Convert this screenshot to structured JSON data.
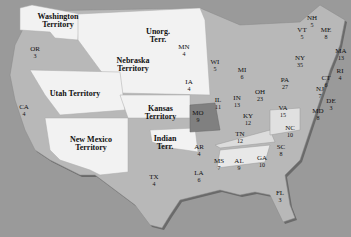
{
  "map": {
    "colors": {
      "ocean": "#9a9a9a",
      "state": "#b8b8b8",
      "territory": "#f2f2f2",
      "highlight": "#808080",
      "light_state": "#dcdcdc"
    },
    "territories": [
      {
        "id": "washington",
        "label": "Washington Territory"
      },
      {
        "id": "nebraska",
        "label": "Nebraska Territory"
      },
      {
        "id": "unorganized",
        "label": "Unorg. Terr."
      },
      {
        "id": "utah",
        "label": "Utah Territory"
      },
      {
        "id": "kansas",
        "label": "Kansas Territory"
      },
      {
        "id": "new-mexico",
        "label": "New Mexico Territory"
      },
      {
        "id": "indian",
        "label": "Indian Terr."
      }
    ],
    "states": [
      {
        "abbr": "OR",
        "value": "3"
      },
      {
        "abbr": "CA",
        "value": "4"
      },
      {
        "abbr": "TX",
        "value": "4"
      },
      {
        "abbr": "MN",
        "value": "4"
      },
      {
        "abbr": "IA",
        "value": "4"
      },
      {
        "abbr": "MO",
        "value": "9"
      },
      {
        "abbr": "AR",
        "value": "4"
      },
      {
        "abbr": "LA",
        "value": "6"
      },
      {
        "abbr": "WI",
        "value": "5"
      },
      {
        "abbr": "IL",
        "value": "11"
      },
      {
        "abbr": "MS",
        "value": "7"
      },
      {
        "abbr": "MI",
        "value": "6"
      },
      {
        "abbr": "IN",
        "value": "13"
      },
      {
        "abbr": "KY",
        "value": "12"
      },
      {
        "abbr": "TN",
        "value": "12"
      },
      {
        "abbr": "AL",
        "value": "9"
      },
      {
        "abbr": "OH",
        "value": "23"
      },
      {
        "abbr": "GA",
        "value": "10"
      },
      {
        "abbr": "FL",
        "value": "3"
      },
      {
        "abbr": "SC",
        "value": "8"
      },
      {
        "abbr": "NC",
        "value": "10"
      },
      {
        "abbr": "VA",
        "value": "15"
      },
      {
        "abbr": "PA",
        "value": "27"
      },
      {
        "abbr": "NY",
        "value": "35"
      },
      {
        "abbr": "VT",
        "value": "5"
      },
      {
        "abbr": "NH",
        "value": "5"
      },
      {
        "abbr": "ME",
        "value": "8"
      },
      {
        "abbr": "MA",
        "value": "13"
      },
      {
        "abbr": "RI",
        "value": "4"
      },
      {
        "abbr": "CT",
        "value": "6"
      },
      {
        "abbr": "NJ",
        "value": "7"
      },
      {
        "abbr": "DE",
        "value": "3"
      },
      {
        "abbr": "MD",
        "value": "8"
      }
    ]
  }
}
